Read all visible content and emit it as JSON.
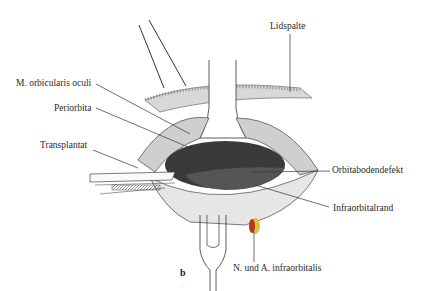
{
  "figure": {
    "panel_label": "b",
    "labels": {
      "lidspalte": "Lidspalte",
      "orbicularis": "M. orbicularis oculi",
      "periorbita": "Periorbita",
      "transplantat": "Transplantat",
      "orbitabodendefekt": "Orbitabodendefekt",
      "infraorbitalrand": "Infraorbitalrand",
      "nerve": "N. und A. infraorbitalis"
    },
    "colors": {
      "line": "#333333",
      "cavity": "#3a3a3a",
      "nerve_red": "#b8341f",
      "nerve_yellow": "#d9c23a"
    }
  }
}
